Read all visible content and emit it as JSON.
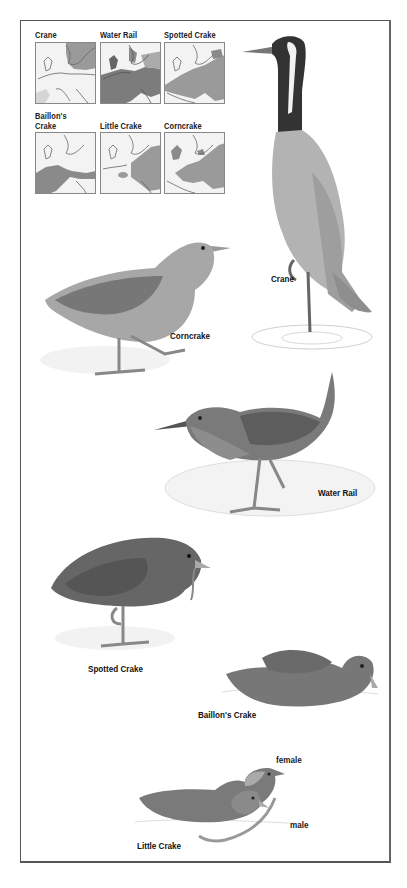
{
  "range_maps": [
    {
      "label": "Crane",
      "range": "north-east"
    },
    {
      "label": "Water Rail",
      "range": "widespread"
    },
    {
      "label": "Spotted Crake",
      "range": "central-east"
    },
    {
      "label": "Baillon's\nCrake",
      "label_line1": "Baillon's",
      "label_line2": "Crake",
      "range": "south-west"
    },
    {
      "label": "Little Crake",
      "range": "east"
    },
    {
      "label": "Corncrake",
      "range": "central-east"
    }
  ],
  "birds": [
    {
      "name": "Crane",
      "label": "Crane"
    },
    {
      "name": "Corncrake",
      "label": "Corncrake"
    },
    {
      "name": "Water Rail",
      "label": "Water Rail"
    },
    {
      "name": "Spotted Crake",
      "label": "Spotted Crake"
    },
    {
      "name": "Baillon's Crake",
      "label": "Baillon's Crake"
    },
    {
      "name": "Little Crake",
      "label": "Little Crake",
      "sexes": [
        "female",
        "male"
      ]
    }
  ],
  "colors": {
    "range_fill": "#9a9a9a",
    "range_fill_dark": "#7c7c7c",
    "land": "#f4f4f4",
    "coast": "#666666",
    "frame": "#555555",
    "plumage_dark": "#555555",
    "plumage_mid": "#8a8a8a",
    "plumage_light": "#bdbdbd"
  }
}
